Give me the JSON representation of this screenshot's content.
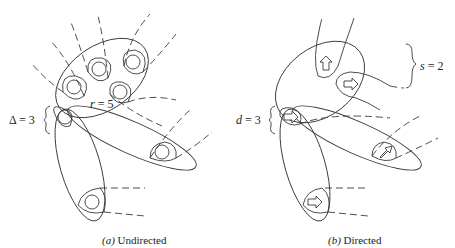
{
  "panels": [
    {
      "id": "a",
      "caption_prefix": "(a)",
      "caption_text": " Undirected",
      "annotations": [
        {
          "symbol": "Δ",
          "equals": " = 3",
          "meaning": "max degree"
        },
        {
          "symbol": "r",
          "equals": " = 5",
          "meaning": "edge size"
        }
      ],
      "node_glyph": "circle"
    },
    {
      "id": "b",
      "caption_prefix": "(b)",
      "caption_text": " Directed",
      "annotations": [
        {
          "symbol": "d",
          "equals": " = 3",
          "meaning": "degree"
        },
        {
          "symbol": "s",
          "equals": " = 2",
          "meaning": "head size"
        }
      ],
      "node_glyph": "arrow"
    }
  ],
  "colors": {
    "stroke": "#3a3a3a",
    "background": "#ffffff",
    "text": "#222222"
  }
}
